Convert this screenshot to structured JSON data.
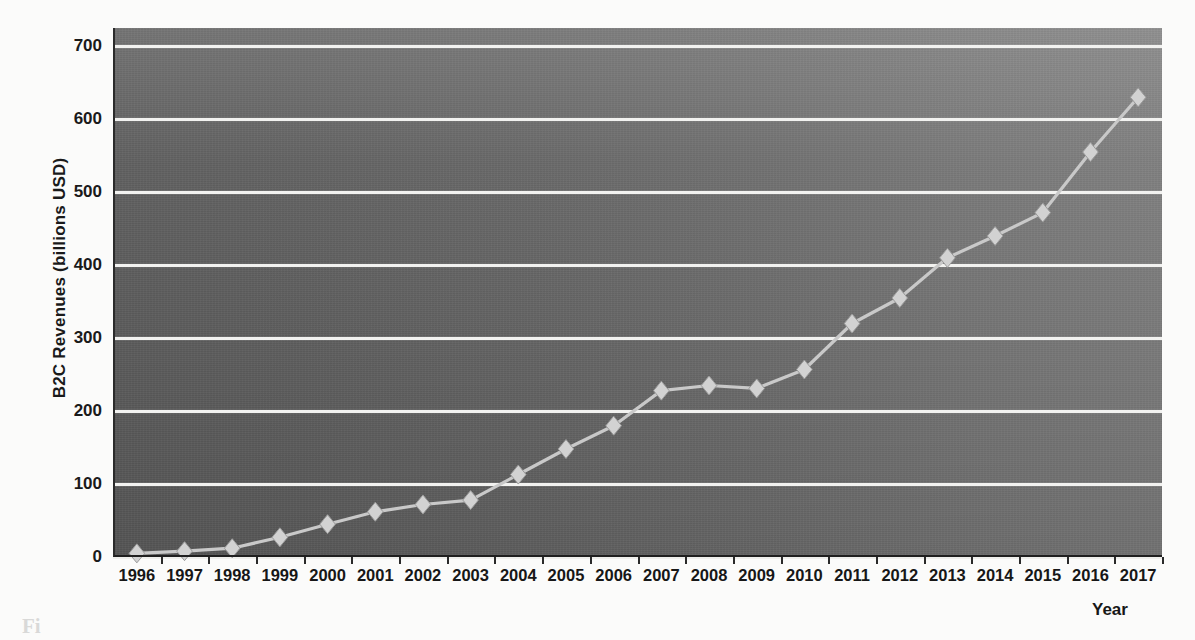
{
  "chart_data": {
    "type": "line",
    "title": "",
    "xlabel": "Year",
    "ylabel": "B2C Revenues (billions USD)",
    "categories": [
      1996,
      1997,
      1998,
      1999,
      2000,
      2001,
      2002,
      2003,
      2004,
      2005,
      2006,
      2007,
      2008,
      2009,
      2010,
      2011,
      2012,
      2013,
      2014,
      2015,
      2016,
      2017
    ],
    "x_tick_labels": [
      "1996",
      "1997",
      "1998",
      "1999",
      "2000",
      "2001",
      "2002",
      "2003",
      "2004",
      "2005",
      "2006",
      "2007",
      "2008",
      "2009",
      "2010",
      "2011",
      "2012",
      "2013",
      "2014",
      "2015",
      "2016",
      "2017"
    ],
    "values": [
      5,
      8,
      12,
      27,
      45,
      62,
      72,
      78,
      113,
      148,
      180,
      228,
      235,
      231,
      257,
      320,
      355,
      410,
      440,
      472,
      555,
      630
    ],
    "y_tick_labels": [
      "0",
      "100",
      "200",
      "300",
      "400",
      "500",
      "600",
      "700"
    ],
    "y_ticks": [
      0,
      100,
      200,
      300,
      400,
      500,
      600,
      700
    ],
    "ylim": [
      0,
      725
    ],
    "xlim": [
      1995.6,
      2017.4
    ],
    "grid": "horizontal",
    "legend": "none",
    "marker": "diamond",
    "series": [
      {
        "name": "B2C Revenues",
        "values": [
          5,
          8,
          12,
          27,
          45,
          62,
          72,
          78,
          113,
          148,
          180,
          228,
          235,
          231,
          257,
          320,
          355,
          410,
          440,
          472,
          555,
          630
        ]
      }
    ],
    "colors": {
      "line": "#c9c9c9",
      "marker_fill": "#d2d2d2",
      "marker_edge": "#9a9a9a",
      "gridline": "#f2f2f0",
      "plot_background_left": "#5e5e5e",
      "plot_background_right": "#7e7e7e",
      "axis": "#2a2a2a",
      "text": "#171717",
      "page_background": "#fbfbfa"
    }
  },
  "caption_fragment": "Fi"
}
